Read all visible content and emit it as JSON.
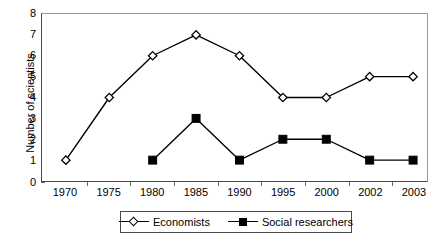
{
  "chart_data": {
    "type": "line",
    "title": "",
    "xlabel": "",
    "ylabel": "Number of scientists",
    "categories": [
      "1970",
      "1975",
      "1980",
      "1985",
      "1990",
      "1995",
      "2000",
      "2002",
      "2003"
    ],
    "ylim": [
      0,
      8
    ],
    "yticks": [
      "0",
      "1",
      "2",
      "3",
      "4",
      "5",
      "6",
      "7",
      "8"
    ],
    "grid": false,
    "legend_position": "bottom",
    "series": [
      {
        "name": "Economists",
        "marker": "open-diamond",
        "color": "#000000",
        "values": [
          1,
          4,
          6,
          7,
          6,
          4,
          4,
          5,
          5
        ]
      },
      {
        "name": "Social researchers",
        "marker": "filled-square",
        "color": "#000000",
        "values": [
          null,
          null,
          1,
          3,
          1,
          2,
          2,
          1,
          1
        ]
      }
    ]
  },
  "legend": {
    "entries": [
      {
        "label": "Economists"
      },
      {
        "label": "Social researchers"
      }
    ]
  }
}
